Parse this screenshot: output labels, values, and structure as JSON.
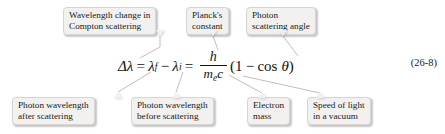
{
  "figure": {
    "equation_number": "(26-8)",
    "equation": {
      "delta_lambda": "Δλ",
      "equals_1": "=",
      "lambda_f": "λ",
      "sub_f": "f",
      "minus": "−",
      "lambda_i": "λ",
      "sub_i": "i",
      "equals_2": "=",
      "numerator": "h",
      "denominator_m": "m",
      "denominator_sub_e": "e",
      "denominator_c": "c",
      "paren_open": "(",
      "one": "1",
      "minus_2": "−",
      "cos": "cos",
      "theta": "θ",
      "paren_close": ")"
    },
    "callouts_top": [
      {
        "name": "wavelength-change",
        "line1": "Wavelength change in",
        "line2": "Compton scattering"
      },
      {
        "name": "plancks-constant",
        "line1": "Planck's",
        "line2": "constant"
      },
      {
        "name": "photon-scattering-angle",
        "line1": "Photon",
        "line2": "scattering angle"
      }
    ],
    "callouts_bottom": [
      {
        "name": "photon-wavelength-after",
        "line1": "Photon wavelength",
        "line2": "after scattering"
      },
      {
        "name": "photon-wavelength-before",
        "line1": "Photon wavelength",
        "line2": "before scattering"
      },
      {
        "name": "electron-mass",
        "line1": "Electron",
        "line2": "mass"
      },
      {
        "name": "speed-of-light",
        "line1": "Speed of light",
        "line2": "in a vacuum"
      }
    ],
    "colors": {
      "box_fill": "#f2f1ef",
      "box_border": "#d7d5d1",
      "text": "#1a1a1a",
      "connector": "#b9b7b3",
      "background": "#ffffff"
    }
  }
}
